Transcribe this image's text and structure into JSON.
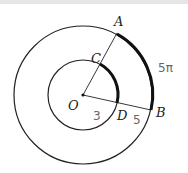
{
  "diagram": {
    "type": "concentric-circles-sector",
    "center": {
      "label": "O",
      "x": 83,
      "y": 95
    },
    "outer_circle": {
      "radius": 69
    },
    "inner_circle": {
      "radius": 35
    },
    "points": {
      "A": {
        "label": "A"
      },
      "B": {
        "label": "B"
      },
      "C": {
        "label": "C"
      },
      "D": {
        "label": "D"
      },
      "O": {
        "label": "O"
      }
    },
    "annotations": {
      "arc_AB": "5π",
      "OD": "3",
      "DB": "5"
    },
    "colors": {
      "stroke": "#222222",
      "handwriting": "#666666"
    }
  }
}
